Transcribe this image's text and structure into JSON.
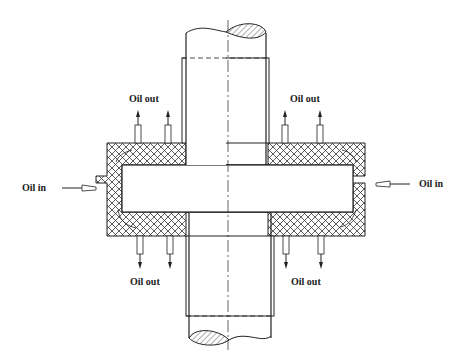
{
  "diagram": {
    "type": "engineering cross-section",
    "labels": {
      "oil_in_left": "Oil in",
      "oil_in_right": "Oil in",
      "oil_out_top_left": "Oil out",
      "oil_out_top_right": "Oil out",
      "oil_out_bottom_left": "Oil out",
      "oil_out_bottom_right": "Oil out"
    },
    "colors": {
      "line": "#222222",
      "background": "#ffffff"
    }
  }
}
